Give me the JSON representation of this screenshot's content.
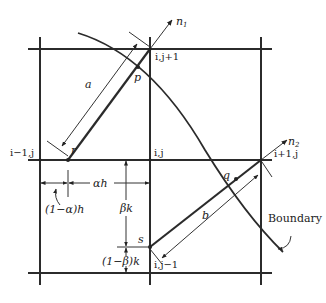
{
  "figure": {
    "nodes": {
      "top_center": "i,j+1",
      "left_center": "i−1,j",
      "center": "i,j",
      "right_center": "i+1,j",
      "bottom_center": "i,j−1"
    },
    "points": {
      "p": "p",
      "q": "q",
      "r": "r",
      "s": "s"
    },
    "normals": {
      "n1": "n",
      "n1_sub": "1",
      "n2": "n",
      "n2_sub": "2"
    },
    "lengths": {
      "a": "a",
      "b": "b"
    },
    "dimensions": {
      "alpha_h": "αh",
      "one_minus_alpha_h": "(1−α)h",
      "beta_k": "βk",
      "one_minus_beta_k": "(1−β)k"
    },
    "boundary_label": "Boundary",
    "colors": {
      "line": "#2b2b2b",
      "background": "#ffffff"
    }
  }
}
